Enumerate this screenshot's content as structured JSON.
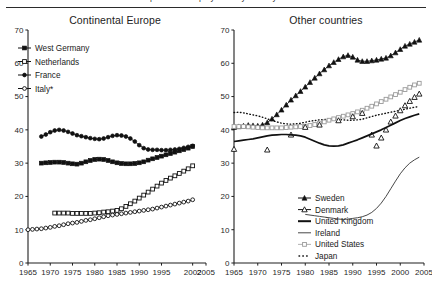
{
  "figure": {
    "cut_caption": "part-time employment by country",
    "y_axis": {
      "min": 0,
      "max": 70,
      "ticks": [
        0,
        10,
        20,
        30,
        40,
        50,
        60,
        70
      ]
    }
  },
  "panels": [
    {
      "key": "continental-europe",
      "title": "Continental Europe",
      "x_ticks": [
        "1965",
        "1970",
        "1975",
        "1980",
        "1985",
        "1990",
        "1995",
        "2002",
        "2005"
      ],
      "x_tick_values": [
        1965,
        1970,
        1975,
        1980,
        1985,
        1990,
        1995,
        2002,
        2005
      ],
      "legend": [
        {
          "label": "West Germany",
          "marker": "filled-square"
        },
        {
          "label": "Netherlands",
          "marker": "open-square"
        },
        {
          "label": "France",
          "marker": "filled-circle"
        },
        {
          "label": "Italy*",
          "marker": "open-circle"
        }
      ]
    },
    {
      "key": "other-countries",
      "title": "Other countries",
      "x_ticks": [
        "1965",
        "1970",
        "1975",
        "1980",
        "1985",
        "1990",
        "1995",
        "2000",
        "2005"
      ],
      "x_tick_values": [
        1965,
        1970,
        1975,
        1980,
        1985,
        1990,
        1995,
        2000,
        2005
      ],
      "legend": [
        {
          "label": "Sweden",
          "marker": "filled-triangle"
        },
        {
          "label": "Denmark",
          "marker": "open-triangle"
        },
        {
          "label": "United Kingdom",
          "marker": "thick-line"
        },
        {
          "label": "Ireland",
          "marker": "thin-line"
        },
        {
          "label": "United States",
          "marker": "gray-square"
        },
        {
          "label": "Japan",
          "marker": "dotted"
        }
      ]
    }
  ],
  "chart_data": [
    {
      "type": "line",
      "title": "Continental Europe",
      "xlabel": "",
      "ylabel": "",
      "xlim": [
        1965,
        2005
      ],
      "ylim": [
        0,
        70
      ],
      "grid": false,
      "legend_position": "upper-left",
      "yticks": [
        0,
        10,
        20,
        30,
        40,
        50,
        60,
        70
      ],
      "xticks": [
        1965,
        1970,
        1975,
        1980,
        1985,
        1990,
        1995,
        2002,
        2005
      ],
      "series": [
        {
          "name": "France",
          "marker": "filled-circle",
          "x": [
            1968,
            1969,
            1970,
            1971,
            1972,
            1973,
            1974,
            1975,
            1976,
            1977,
            1978,
            1979,
            1980,
            1981,
            1982,
            1983,
            1984,
            1985,
            1986,
            1987,
            1988,
            1989,
            1990,
            1991,
            1992,
            1993,
            1994,
            1995,
            1996,
            1997,
            1998,
            1999,
            2000,
            2001,
            2002
          ],
          "values": [
            38.0,
            38.6,
            39.3,
            39.8,
            40.0,
            39.8,
            39.4,
            38.9,
            38.4,
            38.1,
            37.8,
            37.5,
            37.3,
            37.2,
            37.4,
            37.8,
            38.2,
            38.4,
            38.3,
            38.0,
            37.4,
            36.5,
            35.4,
            34.5,
            34.1,
            34.0,
            34.0,
            33.9,
            33.9,
            34.0,
            34.1,
            34.3,
            34.6,
            34.9,
            35.2
          ]
        },
        {
          "name": "West Germany",
          "marker": "filled-square",
          "x": [
            1968,
            1969,
            1970,
            1971,
            1972,
            1973,
            1974,
            1975,
            1976,
            1977,
            1978,
            1979,
            1980,
            1981,
            1982,
            1983,
            1984,
            1985,
            1986,
            1987,
            1988,
            1989,
            1990,
            1991,
            1992,
            1993,
            1994,
            1995,
            1996,
            1997,
            1998,
            1999,
            2000,
            2001,
            2002
          ],
          "values": [
            30.0,
            30.1,
            30.2,
            30.3,
            30.3,
            30.2,
            30.0,
            29.8,
            29.7,
            30.0,
            30.4,
            30.8,
            31.1,
            31.2,
            31.1,
            30.8,
            30.4,
            30.1,
            29.9,
            29.8,
            29.8,
            29.9,
            30.1,
            30.4,
            30.9,
            31.3,
            31.7,
            32.1,
            32.5,
            32.9,
            33.3,
            33.7,
            34.1,
            34.5,
            35.0
          ]
        },
        {
          "name": "Netherlands",
          "marker": "open-square",
          "x": [
            1971,
            1972,
            1973,
            1974,
            1975,
            1976,
            1977,
            1978,
            1979,
            1980,
            1981,
            1982,
            1983,
            1984,
            1985,
            1986,
            1987,
            1988,
            1989,
            1990,
            1991,
            1992,
            1993,
            1994,
            1995,
            1996,
            1997,
            1998,
            1999,
            2000,
            2001,
            2002
          ],
          "values": [
            15.0,
            15.0,
            15.0,
            15.0,
            14.9,
            14.9,
            14.9,
            14.9,
            14.9,
            15.0,
            15.1,
            15.3,
            15.4,
            15.6,
            15.8,
            16.3,
            17.0,
            17.8,
            18.6,
            19.5,
            20.4,
            21.3,
            22.2,
            23.1,
            24.0,
            24.8,
            25.5,
            26.2,
            26.9,
            27.6,
            28.3,
            29.2
          ]
        },
        {
          "name": "Italy*",
          "marker": "open-circle",
          "x": [
            1965,
            1966,
            1967,
            1968,
            1969,
            1970,
            1971,
            1972,
            1973,
            1974,
            1975,
            1976,
            1977,
            1978,
            1979,
            1980,
            1981,
            1982,
            1983,
            1984,
            1985,
            1986,
            1987,
            1988,
            1989,
            1990,
            1991,
            1992,
            1993,
            1994,
            1995,
            1996,
            1997,
            1998,
            1999,
            2000,
            2001,
            2002
          ],
          "values": [
            10.0,
            10.1,
            10.2,
            10.3,
            10.5,
            10.7,
            11.0,
            11.2,
            11.5,
            11.8,
            12.0,
            12.2,
            12.5,
            12.8,
            13.0,
            13.3,
            13.6,
            13.9,
            14.2,
            14.4,
            14.6,
            14.8,
            15.0,
            15.2,
            15.4,
            15.6,
            15.8,
            16.0,
            16.2,
            16.5,
            16.8,
            17.1,
            17.4,
            17.7,
            18.0,
            18.3,
            18.6,
            19.0
          ]
        }
      ]
    },
    {
      "type": "line",
      "title": "Other countries",
      "xlabel": "",
      "ylabel": "",
      "xlim": [
        1965,
        2005
      ],
      "ylim": [
        0,
        70
      ],
      "grid": false,
      "legend_position": "lower-right",
      "yticks": [
        0,
        10,
        20,
        30,
        40,
        50,
        60,
        70
      ],
      "xticks": [
        1965,
        1970,
        1975,
        1980,
        1985,
        1990,
        1995,
        2000,
        2005
      ],
      "series": [
        {
          "name": "Sweden",
          "marker": "filled-triangle",
          "x": [
            1965,
            1966,
            1967,
            1968,
            1969,
            1970,
            1971,
            1972,
            1973,
            1974,
            1975,
            1976,
            1977,
            1978,
            1979,
            1980,
            1981,
            1982,
            1983,
            1984,
            1985,
            1986,
            1987,
            1988,
            1989,
            1990,
            1991,
            1992,
            1993,
            1994,
            1995,
            1996,
            1997,
            1998,
            1999,
            2000,
            2001,
            2002,
            2003,
            2004
          ],
          "values": [
            40.8,
            41.0,
            41.2,
            41.4,
            41.3,
            41.2,
            41.5,
            42.2,
            43.3,
            44.6,
            46.0,
            47.5,
            49.0,
            50.3,
            51.6,
            52.9,
            54.3,
            55.6,
            56.9,
            58.1,
            59.3,
            60.3,
            61.2,
            62.0,
            62.4,
            61.9,
            61.0,
            60.6,
            60.6,
            60.8,
            61.0,
            61.3,
            61.6,
            62.3,
            63.2,
            64.2,
            65.2,
            65.8,
            66.4,
            67.0
          ]
        },
        {
          "name": "Japan",
          "marker": "dotted",
          "x": [
            1965,
            1966,
            1967,
            1968,
            1969,
            1970,
            1971,
            1972,
            1973,
            1974,
            1975,
            1976,
            1977,
            1978,
            1979,
            1980,
            1981,
            1982,
            1983,
            1984,
            1985,
            1986,
            1987,
            1988,
            1989,
            1990,
            1991,
            1992,
            1993,
            1994,
            1995,
            1996,
            1997,
            1998,
            1999,
            2000,
            2001,
            2002,
            2003,
            2004
          ],
          "values": [
            45.2,
            45.3,
            45.1,
            44.8,
            44.5,
            44.2,
            43.8,
            43.3,
            42.8,
            42.4,
            42.0,
            41.8,
            41.7,
            41.8,
            42.0,
            42.3,
            42.6,
            42.8,
            43.0,
            43.1,
            43.2,
            43.2,
            43.1,
            43.0,
            42.9,
            42.9,
            43.0,
            43.2,
            43.6,
            44.0,
            44.4,
            44.7,
            45.0,
            45.3,
            45.6,
            45.9,
            46.2,
            46.5,
            46.8,
            47.0
          ]
        },
        {
          "name": "United States",
          "marker": "gray-square",
          "x": [
            1965,
            1966,
            1967,
            1968,
            1969,
            1970,
            1971,
            1972,
            1973,
            1974,
            1975,
            1976,
            1977,
            1978,
            1979,
            1980,
            1981,
            1982,
            1983,
            1984,
            1985,
            1986,
            1987,
            1988,
            1989,
            1990,
            1991,
            1992,
            1993,
            1994,
            1995,
            1996,
            1997,
            1998,
            1999,
            2000,
            2001,
            2002,
            2003,
            2004
          ],
          "values": [
            41.0,
            41.0,
            41.0,
            40.9,
            40.8,
            40.7,
            40.6,
            40.6,
            40.6,
            40.6,
            40.6,
            40.7,
            40.8,
            40.9,
            41.0,
            41.1,
            41.3,
            41.6,
            42.0,
            42.4,
            42.9,
            43.3,
            43.7,
            44.1,
            44.5,
            44.9,
            45.4,
            45.9,
            46.5,
            47.1,
            47.8,
            48.5,
            49.2,
            49.9,
            50.6,
            51.3,
            52.1,
            52.8,
            53.5,
            54.0
          ]
        },
        {
          "name": "Denmark",
          "marker": "open-triangle",
          "x": [
            1965,
            1972,
            1977,
            1980,
            1983,
            1987,
            1990,
            1992,
            1994,
            1995,
            1996,
            1997,
            1998,
            1999,
            2000,
            2001,
            2002,
            2003,
            2004
          ],
          "values": [
            34.2,
            34.0,
            38.5,
            40.8,
            41.5,
            42.8,
            44.0,
            45.0,
            38.5,
            35.2,
            37.6,
            40.0,
            42.4,
            44.2,
            45.8,
            47.3,
            48.6,
            49.8,
            50.8
          ]
        },
        {
          "name": "United Kingdom",
          "marker": "thick-line",
          "x": [
            1965,
            1966,
            1967,
            1968,
            1969,
            1970,
            1971,
            1972,
            1973,
            1974,
            1975,
            1976,
            1977,
            1978,
            1979,
            1980,
            1981,
            1982,
            1983,
            1984,
            1985,
            1986,
            1987,
            1988,
            1989,
            1990,
            1991,
            1992,
            1993,
            1994,
            1995,
            1996,
            1997,
            1998,
            1999,
            2000,
            2001,
            2002,
            2003,
            2004
          ],
          "values": [
            36.5,
            36.7,
            36.9,
            37.1,
            37.3,
            37.6,
            37.9,
            38.2,
            38.4,
            38.5,
            38.6,
            38.6,
            38.5,
            38.4,
            38.2,
            37.8,
            37.2,
            36.6,
            36.0,
            35.5,
            35.2,
            35.1,
            35.2,
            35.5,
            36.0,
            36.5,
            37.0,
            37.6,
            38.2,
            38.8,
            39.4,
            40.0,
            40.7,
            41.4,
            42.1,
            42.8,
            43.4,
            43.9,
            44.4,
            44.8
          ]
        },
        {
          "name": "Ireland",
          "marker": "thin-line",
          "x": [
            1980,
            1981,
            1982,
            1983,
            1984,
            1985,
            1986,
            1987,
            1988,
            1989,
            1990,
            1991,
            1992,
            1993,
            1994,
            1995,
            1996,
            1997,
            1998,
            1999,
            2000,
            2001,
            2002,
            2003,
            2004
          ],
          "values": [
            14.6,
            14.4,
            14.2,
            14.0,
            13.8,
            13.6,
            13.4,
            13.2,
            13.1,
            13.2,
            13.4,
            13.6,
            13.9,
            14.4,
            15.2,
            16.4,
            18.0,
            20.0,
            22.3,
            24.6,
            26.8,
            28.6,
            30.0,
            31.0,
            31.8
          ]
        }
      ]
    }
  ]
}
